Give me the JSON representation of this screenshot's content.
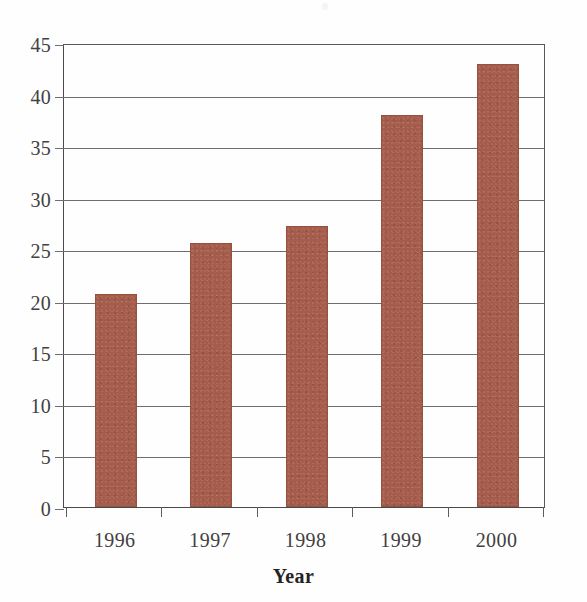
{
  "chart_data": {
    "type": "bar",
    "title": "",
    "subtitle": "",
    "xlabel": "Year",
    "ylabel": "",
    "categories": [
      "1996",
      "1997",
      "1998",
      "1999",
      "2000"
    ],
    "values": [
      20.7,
      25.6,
      27.3,
      38.0,
      43.0
    ],
    "series": [
      {
        "name": "",
        "values": [
          20.7,
          25.6,
          27.3,
          38.0,
          43.0
        ]
      }
    ],
    "ylim": [
      0,
      45
    ],
    "yticks": [
      0,
      5,
      10,
      15,
      20,
      25,
      30,
      35,
      40,
      45
    ],
    "ytick_labels": [
      "0",
      "5",
      "10",
      "15",
      "20",
      "25",
      "30",
      "35",
      "40",
      "45"
    ],
    "grid": true,
    "grid_axis": "y",
    "legend": false,
    "legend_position": "none",
    "bar_color": "#a65c4b",
    "bar_edge_color": "#96513f",
    "grid_color": "#6e6e6e",
    "axis_color": "#4a4a4a",
    "text_color": "#43403f",
    "annotations": []
  }
}
